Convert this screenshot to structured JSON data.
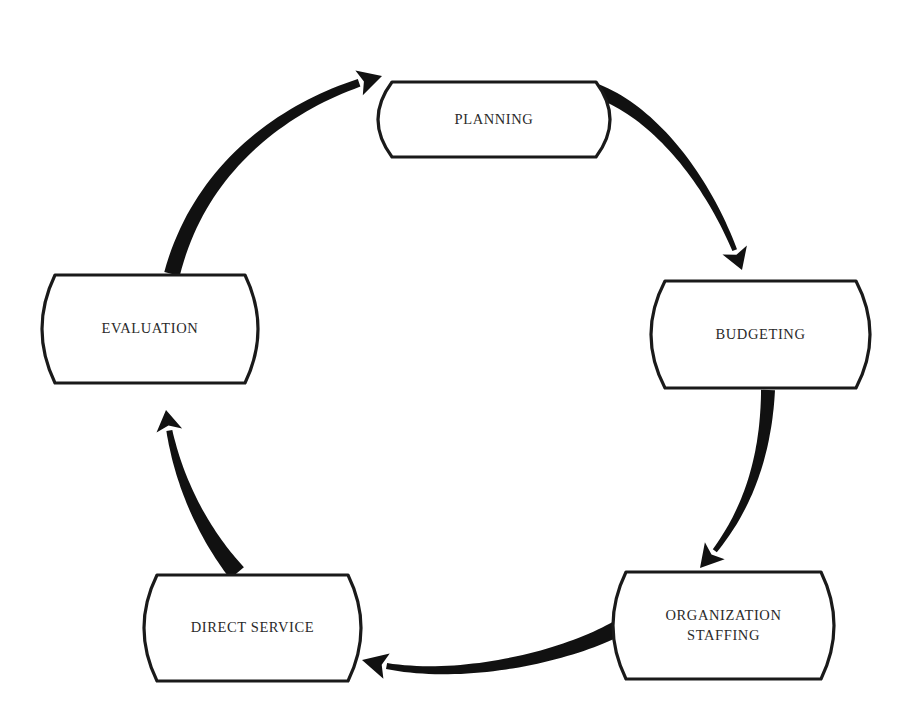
{
  "diagram": {
    "type": "cycle",
    "stages": [
      {
        "id": "planning",
        "lines": [
          "PLANNING"
        ]
      },
      {
        "id": "budgeting",
        "lines": [
          "BUDGETING"
        ]
      },
      {
        "id": "organization-staffing",
        "lines": [
          "ORGANIZATION",
          "STAFFING"
        ]
      },
      {
        "id": "direct-service",
        "lines": [
          "DIRECT SERVICE"
        ]
      },
      {
        "id": "evaluation",
        "lines": [
          "EVALUATION"
        ]
      }
    ],
    "arrows": [
      {
        "from": "planning",
        "to": "budgeting"
      },
      {
        "from": "budgeting",
        "to": "organization-staffing"
      },
      {
        "from": "organization-staffing",
        "to": "direct-service"
      },
      {
        "from": "direct-service",
        "to": "evaluation"
      },
      {
        "from": "evaluation",
        "to": "planning"
      }
    ],
    "colors": {
      "stroke": "#1a1a1a",
      "arrow": "#111111",
      "background": "#ffffff",
      "text": "#2a2a2a"
    }
  }
}
